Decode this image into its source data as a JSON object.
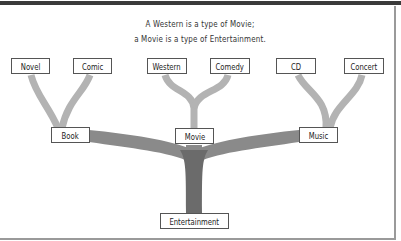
{
  "caption": {
    "line1": "A Western is a type of Movie;",
    "line2": "a Movie is a type of Entertainment."
  },
  "colors": {
    "trunk": "#6b6b6b",
    "mid_branch": "#8a8a8a",
    "leaf_branch": "#b3b3b3",
    "box_border": "#555555",
    "top_bar": "#3a3a3a"
  },
  "tree": {
    "root": "Entertainment",
    "categories": [
      {
        "label": "Book",
        "children": [
          "Novel",
          "Comic"
        ]
      },
      {
        "label": "Movie",
        "children": [
          "Western",
          "Comedy"
        ]
      },
      {
        "label": "Music",
        "children": [
          "CD",
          "Concert"
        ]
      }
    ]
  },
  "nodes": {
    "novel": "Novel",
    "comic": "Comic",
    "western": "Western",
    "comedy": "Comedy",
    "cd": "CD",
    "concert": "Concert",
    "book": "Book",
    "movie": "Movie",
    "music": "Music",
    "entertainment": "Entertainment"
  }
}
